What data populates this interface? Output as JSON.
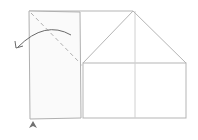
{
  "diagram": {
    "type": "origami-fold-step",
    "colors": {
      "line": "#b5b5b5",
      "crease": "#d0d0d0",
      "dashed": "#b0b0b0",
      "arrow": "#6a6a6a",
      "paper": "#ffffff",
      "flap": "#f9f9f9"
    },
    "elements": {
      "folded_flap": "left rectangular flap",
      "valley_fold_line": "dashed diagonal",
      "fold_arrow": "curved arrow pointing left",
      "roof_triangle": "triangular top",
      "body_square": "bottom rectangle with center crease",
      "view_marker": "small arrowhead below flap"
    }
  }
}
